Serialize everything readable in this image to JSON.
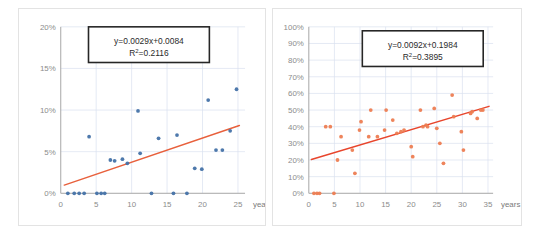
{
  "figure": {
    "background_color": "#ffffff",
    "panel_border_color": "#e3e3e3"
  },
  "chart_data": [
    {
      "type": "scatter",
      "id": "left-chart",
      "title": "",
      "xlabel": "years",
      "ylabel": "",
      "xlim": [
        0,
        26
      ],
      "ylim": [
        0,
        0.2
      ],
      "grid": true,
      "legend": "none",
      "marker_color": "#4472A8",
      "trendline_color": "#E8603C",
      "xticks": [
        0,
        5,
        10,
        15,
        20,
        25
      ],
      "xtick_labels": [
        "0",
        "5",
        "10",
        "15",
        "20",
        "25"
      ],
      "yticks": [
        0,
        0.05,
        0.1,
        0.15,
        0.2
      ],
      "ytick_labels": [
        "0%",
        "5%",
        "10%",
        "15%",
        "20%"
      ],
      "annotation": {
        "equation": "y=0.0029x+0.0084",
        "r_squared_prefix": "R",
        "r_squared_sup": "2",
        "r_squared_value": "=0.2116"
      },
      "trendline": {
        "slope": 0.0029,
        "intercept": 0.0084,
        "x_start": 0.5,
        "x_end": 25.2
      },
      "points": [
        {
          "x": 1.0,
          "y": 0.0
        },
        {
          "x": 1.9,
          "y": 0.0
        },
        {
          "x": 2.6,
          "y": 0.0
        },
        {
          "x": 3.3,
          "y": 0.0
        },
        {
          "x": 5.1,
          "y": 0.0
        },
        {
          "x": 5.7,
          "y": 0.0
        },
        {
          "x": 6.2,
          "y": 0.0
        },
        {
          "x": 12.8,
          "y": 0.0
        },
        {
          "x": 15.9,
          "y": 0.0
        },
        {
          "x": 17.8,
          "y": 0.0
        },
        {
          "x": 4.0,
          "y": 0.068
        },
        {
          "x": 7.0,
          "y": 0.04
        },
        {
          "x": 7.6,
          "y": 0.039
        },
        {
          "x": 8.7,
          "y": 0.041
        },
        {
          "x": 9.4,
          "y": 0.036
        },
        {
          "x": 10.9,
          "y": 0.099
        },
        {
          "x": 11.2,
          "y": 0.048
        },
        {
          "x": 13.8,
          "y": 0.066
        },
        {
          "x": 16.4,
          "y": 0.07
        },
        {
          "x": 18.9,
          "y": 0.03
        },
        {
          "x": 19.9,
          "y": 0.029
        },
        {
          "x": 20.8,
          "y": 0.112
        },
        {
          "x": 21.9,
          "y": 0.052
        },
        {
          "x": 22.8,
          "y": 0.052
        },
        {
          "x": 23.9,
          "y": 0.075
        },
        {
          "x": 24.8,
          "y": 0.125
        }
      ]
    },
    {
      "type": "scatter",
      "id": "right-chart",
      "title": "",
      "xlabel": "years",
      "ylabel": "",
      "xlim": [
        0,
        36
      ],
      "ylim": [
        0,
        1.0
      ],
      "grid": true,
      "legend": "none",
      "marker_color": "#ED7D52",
      "trendline_color": "#E8452C",
      "xticks": [
        0,
        5,
        10,
        15,
        20,
        25,
        30,
        35
      ],
      "xtick_labels": [
        "0",
        "5",
        "10",
        "15",
        "20",
        "25",
        "30",
        "35"
      ],
      "yticks": [
        0,
        0.1,
        0.2,
        0.3,
        0.4,
        0.5,
        0.6,
        0.7,
        0.8,
        0.9,
        1.0
      ],
      "ytick_labels": [
        "0%",
        "10%",
        "20%",
        "30%",
        "40%",
        "50%",
        "60%",
        "70%",
        "80%",
        "90%",
        "100%"
      ],
      "annotation": {
        "equation": "y=0.0092x+0.1984",
        "r_squared_prefix": "R",
        "r_squared_sup": "2",
        "r_squared_value": "=0.3895"
      },
      "trendline": {
        "slope": 0.0092,
        "intercept": 0.1984,
        "x_start": 0.5,
        "x_end": 35.2
      },
      "points": [
        {
          "x": 1.0,
          "y": 0.0
        },
        {
          "x": 1.6,
          "y": 0.0
        },
        {
          "x": 2.1,
          "y": 0.0
        },
        {
          "x": 4.9,
          "y": 0.0
        },
        {
          "x": 3.3,
          "y": 0.4
        },
        {
          "x": 4.2,
          "y": 0.4
        },
        {
          "x": 5.6,
          "y": 0.2
        },
        {
          "x": 6.3,
          "y": 0.34
        },
        {
          "x": 8.5,
          "y": 0.26
        },
        {
          "x": 9.0,
          "y": 0.12
        },
        {
          "x": 9.9,
          "y": 0.38
        },
        {
          "x": 10.2,
          "y": 0.43
        },
        {
          "x": 11.7,
          "y": 0.34
        },
        {
          "x": 12.1,
          "y": 0.5
        },
        {
          "x": 13.4,
          "y": 0.34
        },
        {
          "x": 14.8,
          "y": 0.38
        },
        {
          "x": 15.1,
          "y": 0.5
        },
        {
          "x": 16.4,
          "y": 0.44
        },
        {
          "x": 17.2,
          "y": 0.36
        },
        {
          "x": 18.0,
          "y": 0.37
        },
        {
          "x": 18.6,
          "y": 0.38
        },
        {
          "x": 20.0,
          "y": 0.28
        },
        {
          "x": 20.3,
          "y": 0.22
        },
        {
          "x": 21.8,
          "y": 0.5
        },
        {
          "x": 22.3,
          "y": 0.4
        },
        {
          "x": 22.9,
          "y": 0.41
        },
        {
          "x": 23.2,
          "y": 0.4
        },
        {
          "x": 24.5,
          "y": 0.51
        },
        {
          "x": 25.0,
          "y": 0.39
        },
        {
          "x": 25.6,
          "y": 0.3
        },
        {
          "x": 26.3,
          "y": 0.18
        },
        {
          "x": 28.0,
          "y": 0.59
        },
        {
          "x": 28.3,
          "y": 0.46
        },
        {
          "x": 29.8,
          "y": 0.37
        },
        {
          "x": 30.2,
          "y": 0.26
        },
        {
          "x": 31.6,
          "y": 0.48
        },
        {
          "x": 31.9,
          "y": 0.49
        },
        {
          "x": 32.9,
          "y": 0.45
        },
        {
          "x": 33.6,
          "y": 0.5
        },
        {
          "x": 34.0,
          "y": 0.5
        }
      ]
    }
  ]
}
